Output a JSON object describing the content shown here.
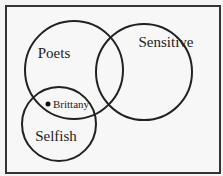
{
  "diagram": {
    "type": "venn",
    "sets": [
      {
        "label": "Poets",
        "cx": 74,
        "cy": 70,
        "r": 49,
        "label_x": 54,
        "label_y": 58
      },
      {
        "label": "Sensitive",
        "cx": 144,
        "cy": 72,
        "r": 48,
        "label_x": 166,
        "label_y": 47
      },
      {
        "label": "Selfish",
        "cx": 59,
        "cy": 124,
        "r": 37,
        "label_x": 56,
        "label_y": 141
      }
    ],
    "point": {
      "label": "Brittany",
      "x": 48,
      "y": 104,
      "label_x": 53,
      "label_y": 111
    },
    "stroke_color": "#222222"
  }
}
